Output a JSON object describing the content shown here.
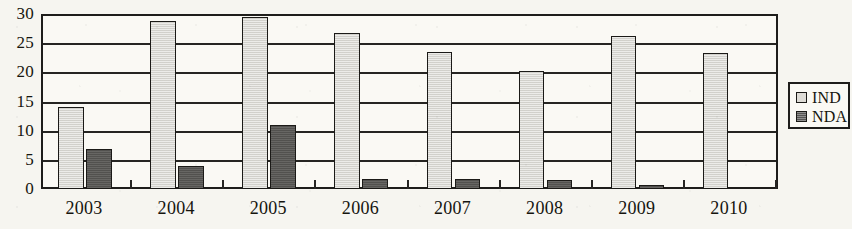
{
  "chart_data": {
    "type": "bar",
    "title": "",
    "xlabel": "",
    "ylabel": "",
    "categories": [
      "2003",
      "2004",
      "2005",
      "2006",
      "2007",
      "2008",
      "2009",
      "2010"
    ],
    "series": [
      {
        "name": "IND",
        "color": "#d9d8d2",
        "values": [
          14.0,
          28.8,
          29.5,
          26.7,
          23.5,
          20.3,
          26.3,
          23.3
        ]
      },
      {
        "name": "NDA",
        "color": "#5b5a57",
        "values": [
          6.8,
          4.0,
          11.0,
          1.7,
          1.7,
          1.6,
          0.7,
          0.0
        ]
      }
    ],
    "ylim": [
      0,
      30
    ],
    "ytick_labels": [
      "0",
      "5",
      "10",
      "15",
      "20",
      "25",
      "30"
    ],
    "ytick_values": [
      0,
      5,
      10,
      15,
      20,
      25,
      30
    ],
    "grid": true,
    "grid_axis": "y",
    "legend_position": "right",
    "legend_entries": [
      {
        "label": "IND",
        "swatch": "light-gray-square"
      },
      {
        "label": "NDA",
        "swatch": "dark-gray-square"
      }
    ]
  },
  "colors": {
    "background": "#f6f5f0",
    "plot_background": "#faf9f4",
    "axis": "#1e1d1b",
    "gridline": "#262522",
    "series_ind": "#d9d8d2",
    "series_nda": "#5b5a57",
    "text": "#15140e"
  }
}
